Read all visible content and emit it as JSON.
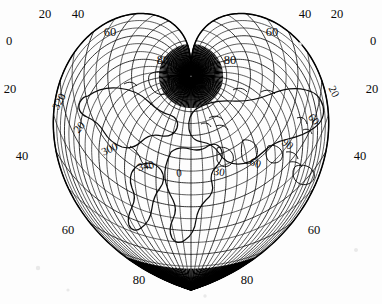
{
  "figure": {
    "kind": "map",
    "projection_name": "Werner cordiform equal-area projection",
    "shape": "heart",
    "background_color": "#fdfdfd",
    "ink_color": "#0a0a0a"
  },
  "chart_data": {
    "type": "map",
    "title": "",
    "projection": "Werner cordiform (heart-shaped) equal-area",
    "grid": true,
    "graticule": {
      "parallel_interval_deg": 10,
      "meridian_interval_deg": 10,
      "parallel_range_deg": [
        -90,
        90
      ],
      "meridian_range_deg": [
        -180,
        180
      ],
      "pole_at_top": "North Pole (cusp)",
      "pole_at_bottom": "South Pole (point)"
    },
    "outer_labels": {
      "description": "Latitude values along the bounding meridian, mirrored left and right",
      "values": [
        0,
        20,
        40,
        60,
        80
      ],
      "left": [
        {
          "text": "20",
          "x": 45,
          "y": 15
        },
        {
          "text": "40",
          "x": 78,
          "y": 15
        },
        {
          "text": "0",
          "x": 9,
          "y": 42
        },
        {
          "text": "60",
          "x": 110,
          "y": 33
        },
        {
          "text": "20",
          "x": 10,
          "y": 90
        },
        {
          "text": "80",
          "x": 163,
          "y": 61
        },
        {
          "text": "40",
          "x": 22,
          "y": 157
        },
        {
          "text": "60",
          "x": 68,
          "y": 231
        },
        {
          "text": "80",
          "x": 139,
          "y": 281
        }
      ],
      "right": [
        {
          "text": "40",
          "x": 305,
          "y": 15
        },
        {
          "text": "20",
          "x": 337,
          "y": 15
        },
        {
          "text": "60",
          "x": 272,
          "y": 33
        },
        {
          "text": "0",
          "x": 373,
          "y": 42
        },
        {
          "text": "80",
          "x": 230,
          "y": 61
        },
        {
          "text": "20",
          "x": 372,
          "y": 90
        },
        {
          "text": "40",
          "x": 360,
          "y": 157
        },
        {
          "text": "60",
          "x": 314,
          "y": 231
        },
        {
          "text": "80",
          "x": 247,
          "y": 281
        }
      ]
    },
    "inner_labels": {
      "description": "Meridian longitude values written inside the graticule",
      "items": [
        {
          "text": "320",
          "x": 60,
          "y": 102,
          "rotate": -62
        },
        {
          "text": "340",
          "x": 59,
          "y": 99,
          "rotate": -58,
          "alt": true
        },
        {
          "text": "20",
          "x": 80,
          "y": 128,
          "rotate": -50
        },
        {
          "text": "300",
          "x": 110,
          "y": 150,
          "rotate": -24
        },
        {
          "text": "340",
          "x": 146,
          "y": 167,
          "rotate": -12
        },
        {
          "text": "0",
          "x": 179,
          "y": 174,
          "rotate": -4
        },
        {
          "text": "30",
          "x": 219,
          "y": 173,
          "rotate": 8
        },
        {
          "text": "60",
          "x": 255,
          "y": 164,
          "rotate": 20
        },
        {
          "text": "90",
          "x": 287,
          "y": 145,
          "rotate": 36
        },
        {
          "text": "60",
          "x": 313,
          "y": 120,
          "rotate": 52
        },
        {
          "text": "20",
          "x": 333,
          "y": 92,
          "rotate": 62
        }
      ]
    },
    "landmasses": [
      "Africa",
      "Eurasia",
      "North America",
      "South America",
      "Greenland",
      "Australia",
      "Arabian Peninsula",
      "India"
    ]
  }
}
